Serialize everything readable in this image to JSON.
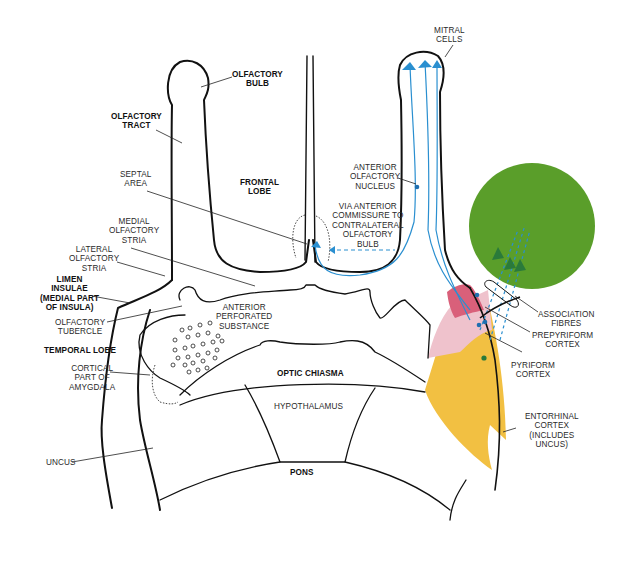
{
  "colors": {
    "outline": "#111111",
    "pathway_blue": "#2a8fd0",
    "neuron_blue": "#1f6fb0",
    "neocortex_green": "#5a9e2a",
    "prepyriform_pink": "#d9607a",
    "pyriform_light_pink": "#efc2cc",
    "entorhinal_yellow": "#f2c042",
    "association_arrow_green": "#2a7a3a"
  },
  "labels": {
    "olfactory_bulb": [
      "OLFACTORY",
      "BULB"
    ],
    "olfactory_tract": [
      "OLFACTORY",
      "TRACT"
    ],
    "septal_area": [
      "SEPTAL",
      "AREA"
    ],
    "frontal_lobe": [
      "FRONTAL",
      "LOBE"
    ],
    "medial_olfactory_stria": [
      "MEDIAL",
      "OLFACTORY",
      "STRIA"
    ],
    "lateral_olfactory_stria": [
      "LATERAL",
      "OLFACTORY",
      "STRIA"
    ],
    "limen_insulae": [
      "LIMEN",
      "INSULAE",
      "(MEDIAL PART",
      "OF INSULA)"
    ],
    "olfactory_tubercle": [
      "OLFACTORY",
      "TUBERCLE"
    ],
    "temporal_lobe": [
      "TEMPORAL LOBE"
    ],
    "cortical_amygdala": [
      "CORTICAL",
      "PART OF",
      "AMYGDALA"
    ],
    "uncus": [
      "UNCUS"
    ],
    "anterior_perforated_substance": [
      "ANTERIOR",
      "PERFORATED",
      "SUBSTANCE"
    ],
    "optic_chiasma": [
      "OPTIC CHIASMA"
    ],
    "hypothalamus": [
      "HYPOTHALAMUS"
    ],
    "pons": [
      "PONS"
    ],
    "mitral_cells": [
      "MITRAL",
      "CELLS"
    ],
    "anterior_olfactory_nucleus": [
      "ANTERIOR",
      "OLFACTORY",
      "NUCLEUS"
    ],
    "via_anterior_commissure": [
      "VIA ANTERIOR",
      "COMMISSURE TO",
      "CONTRALATERAL",
      "OLFACTORY",
      "BULB"
    ],
    "association_fibres": [
      "ASSOCIATION",
      "FIBRES"
    ],
    "prepyriform_cortex": [
      "PREPYRIFORM",
      "CORTEX"
    ],
    "pyriform_cortex": [
      "PYRIFORM",
      "CORTEX"
    ],
    "entorhinal_cortex": [
      "ENTORHINAL",
      "CORTEX",
      "(INCLUDES",
      "UNCUS)"
    ]
  }
}
